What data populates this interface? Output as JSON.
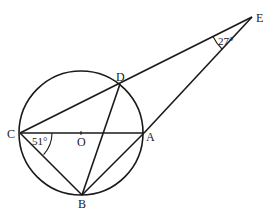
{
  "diagram": {
    "type": "circle-geometry",
    "circle": {
      "center_label": "O",
      "cx": 81,
      "cy": 133,
      "r": 62
    },
    "points": {
      "C": {
        "label": "C",
        "x": 20,
        "y": 133
      },
      "A": {
        "label": "A",
        "x": 144,
        "y": 133
      },
      "O": {
        "label": "O",
        "x": 81,
        "y": 133
      },
      "D": {
        "label": "D",
        "x": 120,
        "y": 84
      },
      "B": {
        "label": "B",
        "x": 82,
        "y": 195
      },
      "E": {
        "label": "E",
        "x": 252,
        "y": 17
      }
    },
    "segments": [
      [
        "C",
        "A"
      ],
      [
        "C",
        "E"
      ],
      [
        "A",
        "E"
      ],
      [
        "C",
        "B"
      ],
      [
        "B",
        "D"
      ],
      [
        "B",
        "A"
      ]
    ],
    "angles": [
      {
        "vertex": "C",
        "label": "51°"
      },
      {
        "vertex": "E",
        "label": "27°"
      }
    ],
    "stroke_color": "#1a1a1a",
    "background": "#ffffff"
  }
}
